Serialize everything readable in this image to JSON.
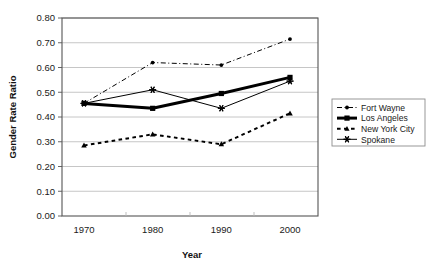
{
  "chart_data": {
    "type": "line",
    "title": "",
    "xlabel": "Year",
    "ylabel": "Gender Rate Ratio",
    "x": [
      1970,
      1980,
      1990,
      2000
    ],
    "categories": [
      "1970",
      "1980",
      "1990",
      "2000"
    ],
    "xlim": [
      1965,
      2005
    ],
    "ylim": [
      0.0,
      0.8
    ],
    "ytick_labels": [
      "0.00",
      "0.10",
      "0.20",
      "0.30",
      "0.40",
      "0.50",
      "0.60",
      "0.70",
      "0.80"
    ],
    "ytick_values": [
      0.0,
      0.1,
      0.2,
      0.3,
      0.4,
      0.5,
      0.6,
      0.7,
      0.8
    ],
    "xtick_labels": [
      "1970",
      "1980",
      "1990",
      "2000"
    ],
    "grid": "horizontal",
    "legend_position": "right",
    "series": [
      {
        "name": "Fort Wayne",
        "values": [
          0.455,
          0.62,
          0.61,
          0.715
        ],
        "marker": "circle",
        "line_style": "dash-dot",
        "color": "#000000",
        "line_width": 1
      },
      {
        "name": "Los Angeles",
        "values": [
          0.455,
          0.435,
          0.495,
          0.56
        ],
        "marker": "square",
        "line_style": "solid",
        "color": "#000000",
        "line_width": 3
      },
      {
        "name": "New York City",
        "values": [
          0.285,
          0.33,
          0.29,
          0.415
        ],
        "marker": "triangle",
        "line_style": "dashed",
        "color": "#000000",
        "line_width": 2
      },
      {
        "name": "Spokane",
        "values": [
          0.455,
          0.51,
          0.435,
          0.545
        ],
        "marker": "star",
        "line_style": "solid",
        "color": "#000000",
        "line_width": 1
      }
    ]
  },
  "legend": {
    "items": [
      {
        "label": "Fort Wayne"
      },
      {
        "label": "Los Angeles"
      },
      {
        "label": "New York City"
      },
      {
        "label": "Spokane"
      }
    ]
  },
  "axes": {
    "y_title": "Gender Rate Ratio",
    "x_title": "Year"
  },
  "colors": {
    "ink": "#000000",
    "grid": "#b8b8b8",
    "frame": "#555555",
    "background": "#ffffff"
  }
}
